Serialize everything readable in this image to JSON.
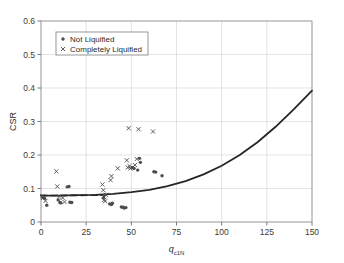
{
  "chart_data": {
    "type": "scatter",
    "title": "",
    "xlabel": "q",
    "xlabel_sub": "c1N",
    "ylabel": "CSR",
    "xlim": [
      0,
      150
    ],
    "ylim": [
      0,
      0.6
    ],
    "xticks": [
      "0",
      "25",
      "50",
      "75",
      "100",
      "125",
      "150"
    ],
    "xtick_values": [
      0,
      25,
      50,
      75,
      100,
      125,
      150
    ],
    "yticks": [
      "0",
      "0.1",
      "0.2",
      "0.3",
      "0.4",
      "0.5",
      "0.6"
    ],
    "ytick_values": [
      0,
      0.1,
      0.2,
      0.3,
      0.4,
      0.5,
      0.6
    ],
    "grid": true,
    "legend_position": "upper-left",
    "legend": [
      {
        "label": "Not Liquified",
        "marker": "dot"
      },
      {
        "label": "Completely Liquified",
        "marker": "cross"
      }
    ],
    "series": [
      {
        "name": "Not Liquified",
        "marker": "dot",
        "color": "#4d4d4d",
        "points": [
          [
            1.0,
            0.073
          ],
          [
            2.0,
            0.07
          ],
          [
            3.2,
            0.05
          ],
          [
            9.5,
            0.066
          ],
          [
            10.5,
            0.058
          ],
          [
            11.0,
            0.057
          ],
          [
            14.5,
            0.105
          ],
          [
            15.5,
            0.106
          ],
          [
            16.0,
            0.059
          ],
          [
            17.0,
            0.058
          ],
          [
            34.5,
            0.072
          ],
          [
            35.0,
            0.08
          ],
          [
            38.0,
            0.054
          ],
          [
            39.0,
            0.052
          ],
          [
            39.5,
            0.056
          ],
          [
            44.5,
            0.045
          ],
          [
            45.5,
            0.044
          ],
          [
            46.0,
            0.042
          ],
          [
            47.0,
            0.043
          ],
          [
            50.5,
            0.163
          ],
          [
            51.5,
            0.16
          ],
          [
            53.5,
            0.155
          ],
          [
            54.5,
            0.19
          ],
          [
            55.0,
            0.178
          ],
          [
            62.5,
            0.15
          ],
          [
            63.5,
            0.149
          ],
          [
            67.0,
            0.138
          ]
        ]
      },
      {
        "name": "Completely Liquified",
        "marker": "cross",
        "color": "#4d4d4d",
        "points": [
          [
            0.8,
            0.077
          ],
          [
            1.2,
            0.072
          ],
          [
            2.5,
            0.063
          ],
          [
            8.5,
            0.151
          ],
          [
            9.0,
            0.106
          ],
          [
            10.0,
            0.076
          ],
          [
            12.0,
            0.072
          ],
          [
            13.0,
            0.06
          ],
          [
            34.0,
            0.112
          ],
          [
            34.5,
            0.095
          ],
          [
            34.8,
            0.075
          ],
          [
            35.0,
            0.066
          ],
          [
            35.5,
            0.062
          ],
          [
            36.0,
            0.081
          ],
          [
            38.5,
            0.125
          ],
          [
            39.0,
            0.137
          ],
          [
            42.5,
            0.16
          ],
          [
            47.5,
            0.184
          ],
          [
            48.0,
            0.163
          ],
          [
            48.5,
            0.28
          ],
          [
            49.0,
            0.167
          ],
          [
            49.5,
            0.16
          ],
          [
            52.0,
            0.17
          ],
          [
            53.0,
            0.188
          ],
          [
            54.0,
            0.277
          ],
          [
            62.0,
            0.27
          ]
        ]
      }
    ],
    "curves": [
      {
        "name": "liquefaction-triggering-curve",
        "style": "solid",
        "color": "#262626",
        "width": 1.8,
        "points": [
          [
            0,
            0.079
          ],
          [
            10,
            0.079
          ],
          [
            20,
            0.08
          ],
          [
            30,
            0.081
          ],
          [
            40,
            0.084
          ],
          [
            50,
            0.089
          ],
          [
            60,
            0.096
          ],
          [
            70,
            0.107
          ],
          [
            80,
            0.122
          ],
          [
            90,
            0.142
          ],
          [
            100,
            0.168
          ],
          [
            110,
            0.2
          ],
          [
            120,
            0.239
          ],
          [
            130,
            0.285
          ],
          [
            140,
            0.337
          ],
          [
            150,
            0.392
          ]
        ]
      },
      {
        "name": "lower-bound-dashed-line",
        "style": "dashed",
        "color": "#262626",
        "width": 1.6,
        "points": [
          [
            0,
            0.079
          ],
          [
            36,
            0.08
          ]
        ]
      }
    ]
  }
}
